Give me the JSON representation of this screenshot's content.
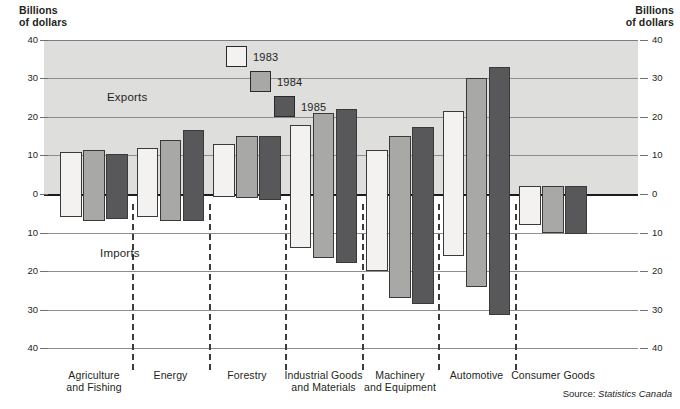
{
  "axis_caption_left": "Billions\nof dollars",
  "axis_caption_right": "Billions\nof dollars",
  "band_labels": {
    "exports": "Exports",
    "imports": "Imports"
  },
  "source": {
    "prefix": "Source: ",
    "name": "Statistics Canada"
  },
  "legend": [
    {
      "label": "1983",
      "color": "#f3f2f0"
    },
    {
      "label": "1984",
      "color": "#a8a8a6"
    },
    {
      "label": "1985",
      "color": "#58585a"
    }
  ],
  "ticks": {
    "upper": [
      "40",
      "30",
      "20",
      "10",
      "0"
    ],
    "lower": [
      "10",
      "20",
      "30",
      "40"
    ]
  },
  "colors": {
    "band": "#dededc",
    "grid": "#8d8d8d",
    "zero_axis": "#1b1b1b",
    "series_1983": "#f3f2f0",
    "series_1984": "#a8a8a6",
    "series_1985": "#58585a",
    "bar_outline": "#3a3a3a",
    "text": "#231f20"
  },
  "chart_data": {
    "type": "bar",
    "title": "",
    "subtitle": "",
    "xlabel": "",
    "ylabel": "Billions of dollars",
    "ylim": [
      -45,
      40
    ],
    "yticks": [
      40,
      30,
      20,
      10,
      0,
      -10,
      -20,
      -30,
      -40
    ],
    "ytick_labels": [
      "40",
      "30",
      "20",
      "10",
      "0",
      "10",
      "20",
      "30",
      "40"
    ],
    "grid": true,
    "legend_position": "top-center",
    "note": "Positive values are Exports, negative values are Imports (plotted below the zero axis).",
    "categories": [
      "Agriculture and Fishing",
      "Energy",
      "Forestry",
      "Industrial Goods and Materials",
      "Machinery and Equipment",
      "Automotive",
      "Consumer Goods"
    ],
    "series": [
      {
        "name": "1983",
        "exports": [
          11.0,
          12.0,
          13.0,
          18.0,
          11.5,
          21.5,
          2.0
        ],
        "imports": [
          -6.0,
          -6.0,
          -0.8,
          -14.0,
          -20.0,
          -16.0,
          -8.0
        ]
      },
      {
        "name": "1984",
        "exports": [
          11.5,
          14.0,
          15.0,
          21.0,
          15.0,
          30.0,
          2.0
        ],
        "imports": [
          -7.0,
          -7.0,
          -1.0,
          -16.5,
          -27.0,
          -24.0,
          -10.0
        ]
      },
      {
        "name": "1985",
        "exports": [
          10.5,
          16.5,
          15.0,
          22.0,
          17.5,
          33.0,
          2.0
        ],
        "imports": [
          -6.5,
          -7.0,
          -1.5,
          -18.0,
          -28.5,
          -31.5,
          -10.5
        ]
      }
    ]
  }
}
